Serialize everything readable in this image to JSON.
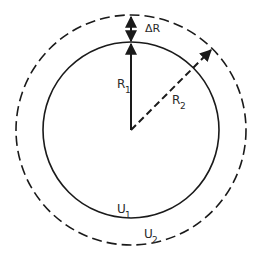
{
  "diagram": {
    "type": "concentric-circles",
    "center": {
      "x": 131,
      "y": 130
    },
    "inner_circle": {
      "label": "U",
      "subscript": "1",
      "radius_px": 88,
      "style": "solid"
    },
    "outer_circle": {
      "label": "U",
      "subscript": "2",
      "radius_px": 115,
      "style": "dashed"
    },
    "radius_1": {
      "label": "R",
      "subscript": "1",
      "style": "solid arrow"
    },
    "radius_2": {
      "label": "R",
      "subscript": "2",
      "style": "dashed arrow"
    },
    "delta": {
      "label": "ΔR",
      "style": "double arrow"
    },
    "stroke_color": "#1a1a1a"
  }
}
